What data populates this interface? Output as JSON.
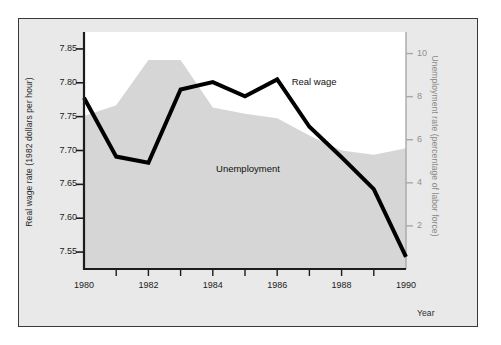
{
  "figure": {
    "background_color": "#e9e9e9",
    "border_color": "#3a3a3a",
    "plot_background_color": "#ffffff"
  },
  "chart_data": {
    "type": "line",
    "title": "",
    "subtitle": "",
    "xlabel": "Year",
    "x": [
      1980,
      1981,
      1982,
      1983,
      1984,
      1985,
      1986,
      1987,
      1988,
      1989,
      1990
    ],
    "xlim": [
      1980,
      1990
    ],
    "xticks_major": [
      1980,
      1982,
      1984,
      1986,
      1988,
      1990
    ],
    "xticks_minor": [
      1981,
      1983,
      1985,
      1987,
      1989
    ],
    "xticklabels": [
      "1980",
      "1982",
      "1984",
      "1986",
      "1988",
      "1990"
    ],
    "grid": false,
    "legend_position": "inline-annotations",
    "axes": [
      {
        "id": "left",
        "label": "Real wage rate (1982 dollars per hour)",
        "color": "#1c1c1c",
        "ylim": [
          7.525,
          7.875
        ],
        "yticks": [
          7.55,
          7.6,
          7.65,
          7.7,
          7.75,
          7.8,
          7.85
        ],
        "yticklabels": [
          "7.55",
          "7.60",
          "7.65",
          "7.70",
          "7.75",
          "7.80",
          "7.85"
        ]
      },
      {
        "id": "right",
        "label": "Unemployment rate (percentage of labor force)",
        "color": "#8f8f8f",
        "ylim": [
          0.0,
          11.0
        ],
        "yticks": [
          2,
          4,
          6,
          8,
          10
        ],
        "yticklabels": [
          "2",
          "4",
          "6",
          "8",
          "10"
        ]
      }
    ],
    "series": [
      {
        "name": "Real wage",
        "axis": "left",
        "style": "line",
        "color": "#000000",
        "line_width": 4,
        "annotation": "Real wage",
        "values": [
          7.778,
          7.691,
          7.682,
          7.79,
          7.801,
          7.78,
          7.805,
          7.735,
          7.69,
          7.643,
          7.543
        ]
      },
      {
        "name": "Unemployment",
        "axis": "right",
        "style": "area",
        "color": "#d6d6d6",
        "annotation": "Unemployment",
        "values": [
          7.1,
          7.6,
          9.7,
          9.7,
          7.5,
          7.2,
          7.0,
          6.2,
          5.5,
          5.3,
          5.6
        ]
      }
    ],
    "annotations": [
      {
        "text": "Real wage",
        "x": 1986.45,
        "y_axis": "left",
        "y": 7.8
      },
      {
        "text": "Unemployment",
        "x": 1984.1,
        "y_axis": "right",
        "y": 4.6
      }
    ]
  }
}
